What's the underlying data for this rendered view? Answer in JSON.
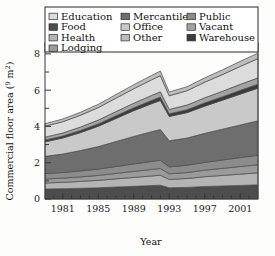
{
  "chart_data": {
    "type": "area",
    "title": "",
    "xlabel": "Year",
    "ylabel": "Commercial floor area (10⁹ m²)",
    "ylabel_unit": "10⁹ m²",
    "xlim": [
      1979,
      2003
    ],
    "ylim": [
      0,
      8.6
    ],
    "grid": false,
    "stacked": true,
    "legend_position": "top",
    "legend_columns": 3,
    "x": [
      1979,
      1981,
      1983,
      1985,
      1987,
      1989,
      1991,
      1992,
      1993,
      1995,
      1997,
      1999,
      2001,
      2003
    ],
    "xticks": [
      1981,
      1985,
      1989,
      1993,
      1997,
      2001
    ],
    "xticklabels": [
      "1981",
      "1985",
      "1989",
      "1993",
      "1997",
      "2001"
    ],
    "yticks": [
      0,
      2,
      4,
      6,
      8
    ],
    "yticklabels": [
      "0",
      "2",
      "4",
      "6",
      "8"
    ],
    "series": [
      {
        "name": "Food",
        "color": "#4d4d4d",
        "values": [
          0.55,
          0.57,
          0.59,
          0.62,
          0.66,
          0.7,
          0.74,
          0.76,
          0.62,
          0.64,
          0.69,
          0.72,
          0.75,
          0.78
        ]
      },
      {
        "name": "Health",
        "color": "#b4b4b4",
        "values": [
          0.33,
          0.35,
          0.38,
          0.41,
          0.45,
          0.49,
          0.53,
          0.55,
          0.46,
          0.49,
          0.54,
          0.58,
          0.62,
          0.66
        ]
      },
      {
        "name": "Lodging",
        "color": "#9a9a9a",
        "values": [
          0.22,
          0.23,
          0.25,
          0.27,
          0.3,
          0.33,
          0.36,
          0.37,
          0.31,
          0.33,
          0.36,
          0.39,
          0.42,
          0.45
        ]
      },
      {
        "name": "Public",
        "color": "#8c8c8c",
        "values": [
          0.3,
          0.31,
          0.33,
          0.35,
          0.38,
          0.41,
          0.44,
          0.45,
          0.38,
          0.4,
          0.43,
          0.46,
          0.49,
          0.52
        ]
      },
      {
        "name": "Mercantile",
        "color": "#6e6e6e",
        "values": [
          0.95,
          1.02,
          1.12,
          1.24,
          1.38,
          1.52,
          1.64,
          1.7,
          1.44,
          1.5,
          1.6,
          1.7,
          1.8,
          1.9
        ]
      },
      {
        "name": "Office",
        "color": "#c9c9c9",
        "values": [
          0.8,
          0.88,
          0.99,
          1.12,
          1.27,
          1.42,
          1.54,
          1.6,
          1.34,
          1.4,
          1.5,
          1.6,
          1.7,
          1.8
        ]
      },
      {
        "name": "Warehouse",
        "color": "#3b3b3b",
        "values": [
          0.1,
          0.11,
          0.12,
          0.13,
          0.15,
          0.16,
          0.18,
          0.19,
          0.15,
          0.16,
          0.18,
          0.19,
          0.21,
          0.22
        ]
      },
      {
        "name": "Vacant",
        "color": "#a3a3a3",
        "values": [
          0.16,
          0.17,
          0.19,
          0.21,
          0.23,
          0.25,
          0.28,
          0.29,
          0.24,
          0.26,
          0.28,
          0.3,
          0.33,
          0.35
        ]
      },
      {
        "name": "Education",
        "color": "#dcdcdc",
        "values": [
          0.6,
          0.62,
          0.65,
          0.69,
          0.74,
          0.8,
          0.86,
          0.89,
          0.75,
          0.79,
          0.86,
          0.92,
          0.99,
          1.06
        ]
      },
      {
        "name": "Other",
        "color": "#bdbdbd",
        "values": [
          0.14,
          0.15,
          0.16,
          0.18,
          0.2,
          0.22,
          0.24,
          0.25,
          0.21,
          0.22,
          0.24,
          0.26,
          0.28,
          0.3
        ]
      }
    ]
  },
  "legend": {
    "columns": [
      [
        {
          "label": "Education",
          "color": "#dcdcdc"
        },
        {
          "label": "Food",
          "color": "#4d4d4d"
        },
        {
          "label": "Health",
          "color": "#b4b4b4"
        },
        {
          "label": "Lodging",
          "color": "#9a9a9a"
        }
      ],
      [
        {
          "label": "Mercantile",
          "color": "#6e6e6e"
        },
        {
          "label": "Office",
          "color": "#c9c9c9"
        },
        {
          "label": "Other",
          "color": "#bdbdbd"
        }
      ],
      [
        {
          "label": "Public",
          "color": "#8c8c8c"
        },
        {
          "label": "Vacant",
          "color": "#a3a3a3"
        },
        {
          "label": "Warehouse",
          "color": "#3b3b3b"
        }
      ]
    ]
  }
}
